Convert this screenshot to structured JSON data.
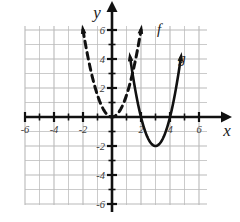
{
  "figure": {
    "title": "",
    "axis_labels": {
      "x": "x",
      "y": "y"
    },
    "curve_labels": {
      "f": "f",
      "g": "g"
    },
    "colors": {
      "grid": "#b9b9b9",
      "axis": "#111111",
      "curve": "#111111",
      "text": "#1a1a1a"
    }
  },
  "chart_data": {
    "type": "line",
    "title": "",
    "xlabel": "x",
    "ylabel": "y",
    "xlim": [
      -6.6,
      6.6
    ],
    "ylim": [
      -6.6,
      6.6
    ],
    "xticks": [
      -6,
      -4,
      -2,
      2,
      4,
      6
    ],
    "yticks": [
      6,
      4,
      2,
      -2,
      -4,
      -6
    ],
    "xtick_labels": [
      "-6",
      "-4",
      "-2",
      "2",
      "4",
      "6"
    ],
    "ytick_labels": [
      "6",
      "4",
      "2",
      "-2",
      "-4",
      "-6"
    ],
    "grid": true,
    "grid_step": 1,
    "legend": "inline-curve-labels",
    "series": [
      {
        "name": "f",
        "label": "f",
        "style": "dashed",
        "shape": "parabola",
        "equation": "f(x) = 1.5x^2",
        "vertex": [
          0,
          0
        ],
        "opens": "up",
        "domain": [
          -2.0,
          2.0
        ],
        "arrow_ends": [
          "left-up",
          "right-up"
        ],
        "points": [
          [
            -2.0,
            6.0
          ],
          [
            -1.5,
            3.4
          ],
          [
            -1.0,
            1.5
          ],
          [
            -0.5,
            0.4
          ],
          [
            0.0,
            0.0
          ],
          [
            0.5,
            0.4
          ],
          [
            1.0,
            1.5
          ],
          [
            1.5,
            3.4
          ],
          [
            2.0,
            6.0
          ]
        ]
      },
      {
        "name": "g",
        "label": "g",
        "style": "solid",
        "shape": "parabola",
        "equation": "g(x) = 2(x-3)^2 - 2",
        "vertex": [
          3,
          -2
        ],
        "opens": "up",
        "domain": [
          1.25,
          4.75
        ],
        "arrow_ends": [
          "left-up",
          "right-up"
        ],
        "x_intercepts": [
          2,
          4
        ],
        "points": [
          [
            1.25,
            4.1
          ],
          [
            1.5,
            2.5
          ],
          [
            2.0,
            0.0
          ],
          [
            2.5,
            -1.5
          ],
          [
            3.0,
            -2.0
          ],
          [
            3.5,
            -1.5
          ],
          [
            4.0,
            0.0
          ],
          [
            4.5,
            2.5
          ],
          [
            4.75,
            4.1
          ]
        ]
      }
    ]
  }
}
